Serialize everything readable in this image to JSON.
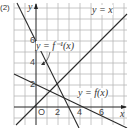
{
  "problem_label": "(2)",
  "axes": {
    "x_label": "x",
    "y_label": "y",
    "origin_label": "O",
    "x_ticks": [
      "2",
      "4",
      "6"
    ],
    "y_ticks": [
      "2",
      "4",
      "6"
    ]
  },
  "curves": [
    {
      "name": "identity",
      "label": "y = x",
      "equation": "y = x"
    },
    {
      "name": "f",
      "label": "y = f(x)",
      "equation": "y = -x/2 + 3"
    },
    {
      "name": "f-inverse",
      "label": "y = f⁻¹(x)",
      "equation": "y = -2x + 6"
    }
  ],
  "intersection": {
    "x": 2,
    "y": 2
  },
  "colors": {
    "grid": "#b8b8b8",
    "axis": "#222222",
    "line": "#2a2a2a",
    "background": "#ffffff"
  }
}
